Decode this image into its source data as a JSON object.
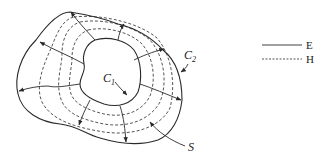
{
  "diagram": {
    "labels": {
      "inner_contour": "C",
      "inner_contour_sub": "1",
      "outer_contour": "C",
      "outer_contour_sub": "2",
      "surface": "S"
    },
    "legend": [
      {
        "style": "solid",
        "label": "E"
      },
      {
        "style": "dashed",
        "label": "H"
      }
    ],
    "colors": {
      "stroke": "#2a2a2a",
      "background": "#ffffff"
    }
  }
}
